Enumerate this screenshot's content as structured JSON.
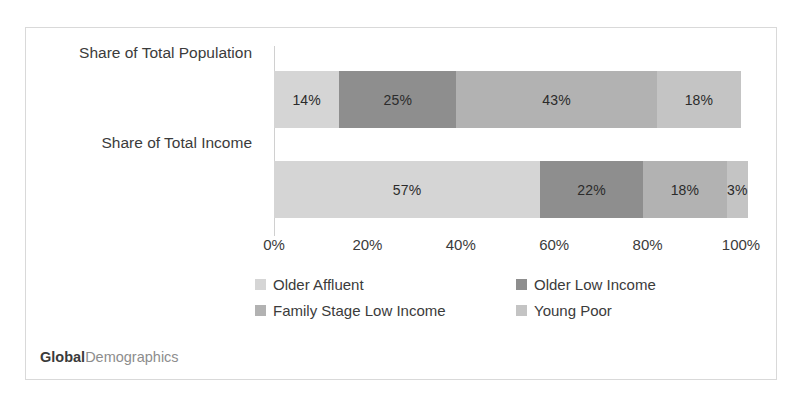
{
  "chart_data": {
    "type": "bar",
    "orientation": "horizontal",
    "stacked": true,
    "normalized_percent": true,
    "title": "",
    "subtitle": "",
    "xlabel": "",
    "ylabel": "",
    "xlim": [
      0,
      100
    ],
    "x_ticks": [
      "0%",
      "20%",
      "40%",
      "60%",
      "80%",
      "100%"
    ],
    "x_tick_values": [
      0,
      20,
      40,
      60,
      80,
      100
    ],
    "grid": false,
    "legend_position": "bottom",
    "categories": [
      "Share of Total Population",
      "Share of Total Income"
    ],
    "series": [
      {
        "name": "Older Affluent",
        "color": "#d5d5d5",
        "values": [
          14,
          57
        ],
        "labels": [
          "14%",
          "57%"
        ]
      },
      {
        "name": "Older Low Income",
        "color": "#8e8e8e",
        "values": [
          25,
          22
        ],
        "labels": [
          "25%",
          "22%"
        ]
      },
      {
        "name": "Family Stage Low Income",
        "color": "#b2b2b2",
        "values": [
          43,
          18
        ],
        "labels": [
          "43%",
          "18%"
        ]
      },
      {
        "name": "Young Poor",
        "color": "#c4c4c4",
        "values": [
          18,
          3
        ],
        "labels": [
          "18%",
          "3%"
        ]
      }
    ]
  },
  "axis": {
    "ticks": [
      {
        "label": "0%",
        "value": 0
      },
      {
        "label": "20%",
        "value": 20
      },
      {
        "label": "40%",
        "value": 40
      },
      {
        "label": "60%",
        "value": 60
      },
      {
        "label": "80%",
        "value": 80
      },
      {
        "label": "100%",
        "value": 100
      }
    ]
  },
  "categories": [
    {
      "label": "Share of Total Population"
    },
    {
      "label": "Share of Total Income"
    }
  ],
  "bars": {
    "population": [
      {
        "series": "Older Affluent",
        "label": "14%",
        "value": 14,
        "color": "#d5d5d5"
      },
      {
        "series": "Older Low Income",
        "label": "25%",
        "value": 25,
        "color": "#8e8e8e"
      },
      {
        "series": "Family Stage Low Income",
        "label": "43%",
        "value": 43,
        "color": "#b2b2b2"
      },
      {
        "series": "Young Poor",
        "label": "18%",
        "value": 18,
        "color": "#c4c4c4"
      }
    ],
    "income": [
      {
        "series": "Older Affluent",
        "label": "57%",
        "value": 57,
        "color": "#d5d5d5"
      },
      {
        "series": "Older Low Income",
        "label": "22%",
        "value": 22,
        "color": "#8e8e8e"
      },
      {
        "series": "Family Stage Low Income",
        "label": "18%",
        "value": 18,
        "color": "#b2b2b2"
      },
      {
        "series": "Young Poor",
        "label": "3%",
        "value": 3,
        "color": "#c4c4c4"
      }
    ]
  },
  "legend": {
    "items": [
      {
        "label": "Older Affluent",
        "color": "#d5d5d5"
      },
      {
        "label": "Older Low Income",
        "color": "#8e8e8e"
      },
      {
        "label": "Family Stage Low Income",
        "color": "#b2b2b2"
      },
      {
        "label": "Young Poor",
        "color": "#c4c4c4"
      }
    ]
  },
  "brand": {
    "bold_text": "Global",
    "light_text": "Demographics"
  },
  "colors": {
    "frame_border": "#d9d9d9",
    "axis_line": "#d0d0d0",
    "text": "#3b3b3b",
    "background": "#ffffff"
  }
}
